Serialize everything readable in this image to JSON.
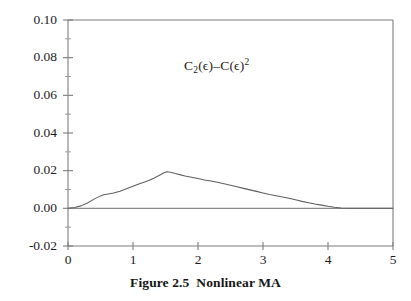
{
  "figure": {
    "caption_prefix": "Figure 2.5",
    "caption_title": "Nonlinear MA",
    "annotation_plain": "C2(ϵ)-C(ϵ)2",
    "annotation_parts": {
      "c_main": "C",
      "c_sub": "2",
      "arg_one": "(ϵ)–C(ϵ)",
      "exp": "2"
    }
  },
  "colors": {
    "background": "#ffffff",
    "axis": "#7d7d7d",
    "curve": "#5f5f5f",
    "zero_line": "#8a8a8a",
    "text": "#1c1c1c"
  },
  "chart_data": {
    "type": "line",
    "xlabel": "",
    "ylabel": "",
    "annotation": "C2(ϵ)-C(ϵ)2",
    "grid": false,
    "legend": "none",
    "xlim": [
      0,
      5
    ],
    "ylim": [
      -0.02,
      0.1
    ],
    "xticks": [
      0,
      1,
      2,
      3,
      4,
      5
    ],
    "xtick_labels": [
      "0",
      "1",
      "2",
      "3",
      "4",
      "5"
    ],
    "yticks": [
      -0.02,
      0.0,
      0.02,
      0.04,
      0.06,
      0.08,
      0.1
    ],
    "ytick_labels": [
      "-0.02",
      "0.00",
      "0.02",
      "0.04",
      "0.06",
      "0.08",
      "0.10"
    ],
    "minor_ticks_per_interval": 1,
    "zero_reference_line": 0.0,
    "series": [
      {
        "name": "C2(eps)-C(eps)^2",
        "x": [
          0.0,
          0.1,
          0.2,
          0.3,
          0.4,
          0.5,
          0.55,
          0.62,
          0.7,
          0.8,
          0.9,
          1.0,
          1.1,
          1.18,
          1.25,
          1.32,
          1.4,
          1.47,
          1.52,
          1.58,
          1.65,
          1.72,
          1.8,
          1.9,
          2.0,
          2.1,
          2.2,
          2.3,
          2.4,
          2.5,
          2.6,
          2.7,
          2.8,
          2.9,
          3.0,
          3.1,
          3.2,
          3.3,
          3.4,
          3.5,
          3.6,
          3.7,
          3.8,
          3.9,
          4.0,
          4.1,
          4.2,
          4.35,
          4.5,
          4.7,
          4.85,
          5.0
        ],
        "y": [
          0.0,
          0.0004,
          0.0013,
          0.0028,
          0.0049,
          0.0066,
          0.0072,
          0.0076,
          0.0081,
          0.0091,
          0.0104,
          0.0117,
          0.013,
          0.014,
          0.0149,
          0.016,
          0.0174,
          0.0188,
          0.0194,
          0.0192,
          0.0185,
          0.0179,
          0.0172,
          0.0165,
          0.0158,
          0.0151,
          0.0145,
          0.0138,
          0.013,
          0.0122,
          0.0114,
          0.0106,
          0.0098,
          0.009,
          0.0082,
          0.0074,
          0.0067,
          0.006,
          0.0053,
          0.0045,
          0.0037,
          0.003,
          0.0023,
          0.0017,
          0.0011,
          0.0006,
          0.0002,
          0.0,
          0.0,
          0.0,
          0.0,
          0.0
        ]
      }
    ]
  }
}
